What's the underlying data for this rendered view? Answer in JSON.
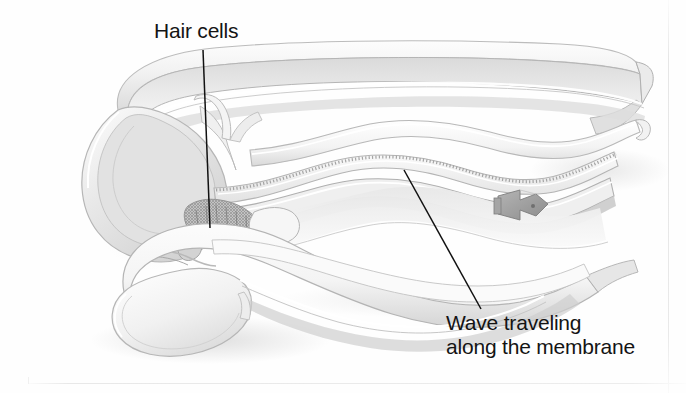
{
  "figure": {
    "kind": "anatomical-illustration",
    "background_color": "#fefefe",
    "ink_color": "#141414",
    "shading_colors": {
      "outline": "#b9b9b9",
      "light_fill": "#f7f7f7",
      "mid_fill": "#e4e4e4",
      "dark_fill": "#cfcfcf",
      "deep_shadow": "#a9a9a9",
      "marker_gray": "#9a9a9a"
    }
  },
  "labels": {
    "hair_cells": {
      "text": "Hair cells",
      "leader": {
        "x1": 203,
        "y1": 50,
        "x2": 210,
        "y2": 228
      }
    },
    "wave": {
      "line1": "Wave traveling",
      "line2": "along the membrane",
      "leader": {
        "x1": 404,
        "y1": 170,
        "x2": 481,
        "y2": 309
      }
    }
  },
  "parts": [
    {
      "name": "vestibular-canal-upper-chamber"
    },
    {
      "name": "tympanic-canal-lower-chamber"
    },
    {
      "name": "basilar-membrane-wave"
    },
    {
      "name": "hair-cell-region"
    },
    {
      "name": "helicotrema-bulb-left"
    },
    {
      "name": "scale-marker-clip"
    }
  ],
  "frame": {
    "right_rule_x": 668,
    "bottom_rule_y": 383
  }
}
